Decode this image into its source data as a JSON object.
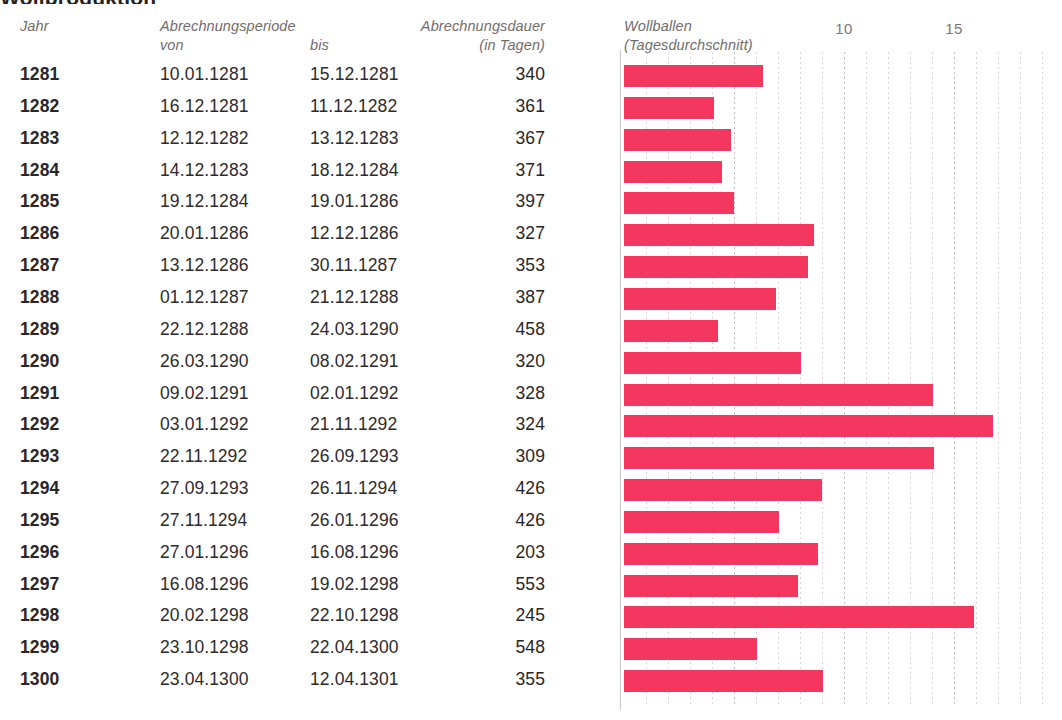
{
  "page": {
    "title_sliver": "Wollproduktion",
    "background": "#ffffff",
    "bar_color": "#F4375F",
    "grid_color": "#b9b7b8",
    "text_color": "#2a2526",
    "header_color": "#6f6d6e"
  },
  "table": {
    "headers": {
      "jahr": "Jahr",
      "periode": "Abrechnungsperiode",
      "von": "von",
      "bis": "bis",
      "dauer": "Abrechnungsdauer",
      "dauer_unit": "(in Tagen)"
    },
    "rows": [
      {
        "jahr": "1281",
        "von": "10.01.1281",
        "bis": "15.12.1281",
        "dauer": "340"
      },
      {
        "jahr": "1282",
        "von": "16.12.1281",
        "bis": "11.12.1282",
        "dauer": "361"
      },
      {
        "jahr": "1283",
        "von": "12.12.1282",
        "bis": "13.12.1283",
        "dauer": "367"
      },
      {
        "jahr": "1284",
        "von": "14.12.1283",
        "bis": "18.12.1284",
        "dauer": "371"
      },
      {
        "jahr": "1285",
        "von": "19.12.1284",
        "bis": "19.01.1286",
        "dauer": "397"
      },
      {
        "jahr": "1286",
        "von": "20.01.1286",
        "bis": "12.12.1286",
        "dauer": "327"
      },
      {
        "jahr": "1287",
        "von": "13.12.1286",
        "bis": "30.11.1287",
        "dauer": "353"
      },
      {
        "jahr": "1288",
        "von": "01.12.1287",
        "bis": "21.12.1288",
        "dauer": "387"
      },
      {
        "jahr": "1289",
        "von": "22.12.1288",
        "bis": "24.03.1290",
        "dauer": "458"
      },
      {
        "jahr": "1290",
        "von": "26.03.1290",
        "bis": "08.02.1291",
        "dauer": "320"
      },
      {
        "jahr": "1291",
        "von": "09.02.1291",
        "bis": "02.01.1292",
        "dauer": "328"
      },
      {
        "jahr": "1292",
        "von": "03.01.1292",
        "bis": "21.11.1292",
        "dauer": "324"
      },
      {
        "jahr": "1293",
        "von": "22.11.1292",
        "bis": "26.09.1293",
        "dauer": "309"
      },
      {
        "jahr": "1294",
        "von": "27.09.1293",
        "bis": "26.11.1294",
        "dauer": "426"
      },
      {
        "jahr": "1295",
        "von": "27.11.1294",
        "bis": "26.01.1296",
        "dauer": "426"
      },
      {
        "jahr": "1296",
        "von": "27.01.1296",
        "bis": "16.08.1296",
        "dauer": "203"
      },
      {
        "jahr": "1297",
        "von": "16.08.1296",
        "bis": "19.02.1298",
        "dauer": "553"
      },
      {
        "jahr": "1298",
        "von": "20.02.1298",
        "bis": "22.10.1298",
        "dauer": "245"
      },
      {
        "jahr": "1299",
        "von": "23.10.1298",
        "bis": "22.04.1300",
        "dauer": "548"
      },
      {
        "jahr": "1300",
        "von": "23.04.1300",
        "bis": "12.04.1301",
        "dauer": "355"
      }
    ]
  },
  "chart_data": {
    "type": "bar",
    "orientation": "horizontal",
    "title": "Wollballen",
    "subtitle": "(Tagesdurchschnitt)",
    "xlabel": "",
    "ylabel": "",
    "xlim": [
      0,
      19.9
    ],
    "grid": true,
    "grid_step": 1,
    "legend": "none",
    "tick_labels": [
      {
        "value": 10,
        "label": "10"
      },
      {
        "value": 15,
        "label": "15"
      }
    ],
    "categories": [
      "1281",
      "1282",
      "1283",
      "1284",
      "1285",
      "1286",
      "1287",
      "1288",
      "1289",
      "1290",
      "1291",
      "1292",
      "1293",
      "1294",
      "1295",
      "1296",
      "1297",
      "1298",
      "1299",
      "1300"
    ],
    "values": [
      6.33,
      4.09,
      4.85,
      4.44,
      5.0,
      8.64,
      8.38,
      6.89,
      4.29,
      8.03,
      14.06,
      16.79,
      14.11,
      8.99,
      7.06,
      8.83,
      7.92,
      15.92,
      6.06,
      9.06
    ]
  }
}
